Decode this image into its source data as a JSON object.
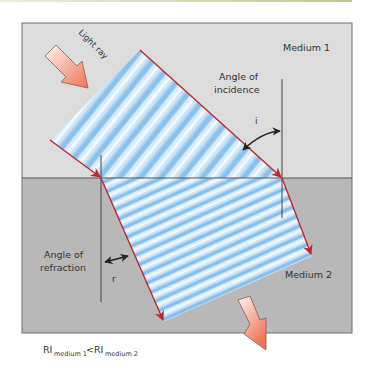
{
  "diagram": {
    "labels": {
      "light_ray": "Light ray",
      "medium_1": "Medium 1",
      "medium_2": "Medium 2",
      "angle_incidence_line1": "Angle of",
      "angle_incidence_line2": "incidence",
      "angle_refraction_line1": "Angle of",
      "angle_refraction_line2": "refraction",
      "angle_i": "i",
      "angle_r": "r",
      "ri_base_1": "RI",
      "ri_sub_1": "medium 1",
      "ri_lt": " < ",
      "ri_base_2": "RI",
      "ri_sub_2": "medium 2"
    },
    "colors": {
      "medium_1_bg": "#dcdcdc",
      "medium_2_bg": "#b9b9b9",
      "border": "#6f6f6f",
      "ray_edge": "#c0262d",
      "wave_light": "#eaf4fd",
      "wave_dark": "#8fc3ee",
      "arrow_fill_start": "#fff0ea",
      "arrow_fill_end": "#f07a5e"
    }
  }
}
